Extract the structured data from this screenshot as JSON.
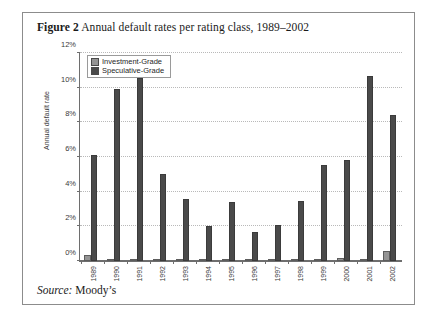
{
  "figure": {
    "label": "Figure 2",
    "caption": "Annual default rates per rating class, 1989–2002",
    "source_label": "Source:",
    "source_value": "Moody’s"
  },
  "legend": {
    "items": [
      {
        "name": "investment-grade",
        "label": "Investment-Grade",
        "color": "#949494"
      },
      {
        "name": "speculative-grade",
        "label": "Speculative-Grade",
        "color": "#4a4a4a"
      }
    ]
  },
  "chart_data": {
    "type": "bar",
    "title": "Annual default rates per rating class, 1989–2002",
    "xlabel": "",
    "ylabel": "Annual default rate",
    "categories": [
      "1989",
      "1990",
      "1991",
      "1992",
      "1993",
      "1994",
      "1995",
      "1996",
      "1997",
      "1998",
      "1999",
      "2000",
      "2001",
      "2002"
    ],
    "series": [
      {
        "name": "Investment-Grade",
        "color": "#949494",
        "values": [
          0.35,
          0.0,
          0.07,
          0.0,
          0.0,
          0.05,
          0.0,
          0.0,
          0.0,
          0.05,
          0.05,
          0.15,
          0.12,
          0.55
        ]
      },
      {
        "name": "Speculative-Grade",
        "color": "#4a4a4a",
        "values": [
          6.1,
          9.95,
          10.55,
          5.0,
          3.55,
          2.0,
          3.4,
          1.7,
          2.05,
          3.45,
          5.55,
          5.85,
          10.7,
          8.4
        ]
      }
    ],
    "ylim": [
      0,
      12
    ],
    "yticks": [
      0,
      2,
      4,
      6,
      8,
      10,
      12
    ],
    "ytick_labels": [
      "0%",
      "2%",
      "4%",
      "6%",
      "8%",
      "10%",
      "12%"
    ],
    "grid": true,
    "legend_position": "top-left"
  }
}
